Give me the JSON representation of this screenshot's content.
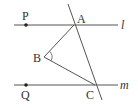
{
  "diagram": {
    "colors": {
      "line": "#555555",
      "text": "#333333",
      "background": "#ffffff"
    },
    "lines": [
      {
        "id": "l",
        "label": "l",
        "from": [
          14,
          25
        ],
        "to": [
          118,
          25
        ]
      },
      {
        "id": "m",
        "label": "m",
        "from": [
          14,
          85
        ],
        "to": [
          118,
          85
        ]
      },
      {
        "id": "transversal",
        "label": "",
        "from": [
          68,
          4
        ],
        "to": [
          102,
          100
        ]
      }
    ],
    "segments": [
      {
        "id": "AB",
        "from": "A",
        "to": "B"
      },
      {
        "id": "BC",
        "from": "B",
        "to": "C"
      }
    ],
    "points": {
      "P": {
        "label": "P",
        "x": 26,
        "y": 25,
        "dot": true
      },
      "A": {
        "label": "A",
        "x": 74,
        "y": 25,
        "dot": false
      },
      "B": {
        "label": "B",
        "x": 44,
        "y": 57,
        "dot": false
      },
      "Q": {
        "label": "Q",
        "x": 26,
        "y": 85,
        "dot": true
      },
      "C": {
        "label": "C",
        "x": 95,
        "y": 85,
        "dot": false
      }
    },
    "angle_marks": [
      {
        "vertex": "B",
        "between": [
          "A",
          "C"
        ]
      }
    ],
    "labels": {
      "P": "P",
      "A": "A",
      "B": "B",
      "Q": "Q",
      "C": "C",
      "l": "l",
      "m": "m"
    }
  }
}
